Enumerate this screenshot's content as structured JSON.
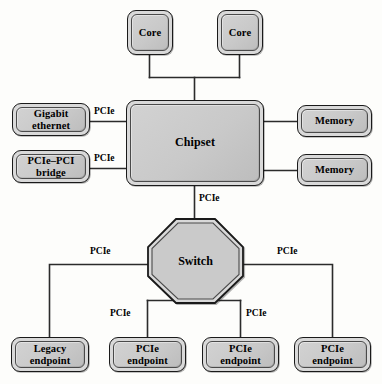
{
  "diagram": {
    "colors": {
      "node_fill": "#d2d2d2",
      "node_border": "#1a1a1a",
      "inner_border": "#4a4a4a",
      "wire": "#2b2b2b",
      "background": "#fdfdfb"
    },
    "nodes": {
      "core1": {
        "label": "Core"
      },
      "core2": {
        "label": "Core"
      },
      "chipset": {
        "label": "Chipset"
      },
      "gigabit_ethernet": {
        "label": "Gigabit\nethernet",
        "line1": "Gigabit",
        "line2": "ethernet"
      },
      "pcie_pci_bridge": {
        "label": "PCIe–PCI\nbridge",
        "line1": "PCIe–PCI",
        "line2": "bridge"
      },
      "memory1": {
        "label": "Memory"
      },
      "memory2": {
        "label": "Memory"
      },
      "switch": {
        "label": "Switch"
      },
      "legacy_endpoint": {
        "label": "Legacy\nendpoint",
        "line1": "Legacy",
        "line2": "endpoint"
      },
      "pcie_endpoint1": {
        "label": "PCIe\nendpoint",
        "line1": "PCIe",
        "line2": "endpoint"
      },
      "pcie_endpoint2": {
        "label": "PCIe\nendpoint",
        "line1": "PCIe",
        "line2": "endpoint"
      },
      "pcie_endpoint3": {
        "label": "PCIe\nendpoint",
        "line1": "PCIe",
        "line2": "endpoint"
      }
    },
    "edge_labels": {
      "ethernet_to_chipset": "PCIe",
      "bridge_to_chipset": "PCIe",
      "chipset_to_switch": "PCIe",
      "switch_to_legacy": "PCIe",
      "switch_to_endpoint1": "PCIe",
      "switch_to_endpoint2": "PCIe",
      "switch_to_endpoint3": "PCIe"
    }
  }
}
